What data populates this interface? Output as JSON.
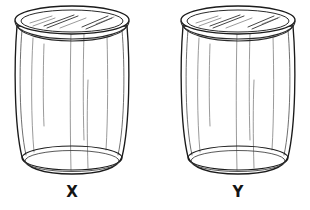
{
  "figure": {
    "type": "line-drawing",
    "background_color": "#ffffff",
    "line_color": "#1b1b1b",
    "width": 310,
    "height": 210
  },
  "jars": [
    {
      "id": "jar-x",
      "label": "X",
      "label_x": 72,
      "label_y": 196,
      "center_x": 72,
      "rim_cx": 72,
      "rim_cy": 22,
      "rim_rx": 57,
      "rim_ry": 14,
      "body_top_y": 26,
      "body_bottom_y": 170,
      "base_cx": 72,
      "base_cy": 168,
      "base_rx": 50,
      "base_ry": 11
    },
    {
      "id": "jar-y",
      "label": "Y",
      "label_x": 238,
      "label_y": 196,
      "center_x": 238,
      "rim_cx": 238,
      "rim_cy": 22,
      "rim_rx": 57,
      "rim_ry": 14,
      "body_top_y": 26,
      "body_bottom_y": 170,
      "base_cx": 238,
      "base_cy": 168,
      "base_rx": 50,
      "base_ry": 11
    }
  ],
  "caption": {
    "left_label": "X",
    "right_label": "Y"
  }
}
